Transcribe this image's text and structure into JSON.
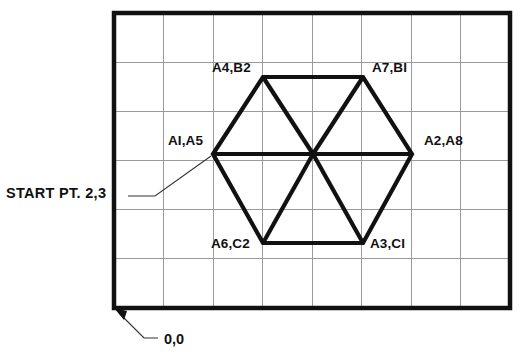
{
  "diagram": {
    "colors": {
      "frame": "#111111",
      "grid": "#9a9a9a",
      "shape": "#111111",
      "leader": "#333333",
      "text": "#111111",
      "background": "#ffffff"
    },
    "frame": {
      "x": 114,
      "y": 13,
      "width": 396,
      "height": 295,
      "stroke_width": 4.5,
      "columns": 8,
      "rows": 6
    },
    "grid": {
      "visible": true,
      "stroke_width": 1,
      "cell_width": 49.5,
      "cell_height": 49.17,
      "vertical_lines": [
        163.5,
        213,
        262.5,
        312,
        361.5,
        411,
        460.5
      ],
      "horizontal_lines": [
        62.2,
        111.3,
        160.5,
        209.7,
        258.8
      ]
    },
    "shape": {
      "type": "hexagon-with-internal-triangles",
      "stroke_width": 4.2,
      "center": {
        "x": 313,
        "y": 154
      },
      "vertices": [
        {
          "id": "v1",
          "label": "AI,A5",
          "x": 213,
          "y": 154,
          "grid": "2,3",
          "label_x": 168,
          "label_y": 145,
          "anchor": "start"
        },
        {
          "id": "v2",
          "label": "A4,B2",
          "x": 263,
          "y": 77,
          "grid": "3,4.7",
          "label_x": 212,
          "label_y": 72,
          "anchor": "start"
        },
        {
          "id": "v3",
          "label": "A7,BI",
          "x": 363,
          "y": 77,
          "grid": "5,4.7",
          "label_x": 372,
          "label_y": 72,
          "anchor": "start"
        },
        {
          "id": "v4",
          "label": "A2,A8",
          "x": 412,
          "y": 154,
          "grid": "6,3",
          "label_x": 424,
          "label_y": 145,
          "anchor": "start"
        },
        {
          "id": "v5",
          "label": "A3,CI",
          "x": 363,
          "y": 243,
          "grid": "5,1.3",
          "label_x": 370,
          "label_y": 248,
          "anchor": "start"
        },
        {
          "id": "v6",
          "label": "A6,C2",
          "x": 263,
          "y": 243,
          "grid": "3,1.3",
          "label_x": 211,
          "label_y": 248,
          "anchor": "start"
        }
      ],
      "internal_lines": [
        {
          "from": "v1",
          "to": "v4",
          "description": "horizontal-diameter"
        },
        {
          "from": "v2",
          "to": "center",
          "description": "spoke-upper-left"
        },
        {
          "from": "v3",
          "to": "center",
          "description": "spoke-upper-right"
        },
        {
          "from": "v5",
          "to": "center",
          "description": "spoke-lower-right"
        },
        {
          "from": "v6",
          "to": "center",
          "description": "spoke-lower-left"
        }
      ]
    },
    "annotations": {
      "start_point": {
        "text": "START PT. 2,3",
        "text_x": 6,
        "text_y": 198,
        "leader": {
          "x1": 128,
          "y1": 196,
          "x2": 155,
          "y2": 196,
          "x3": 211,
          "y3": 156
        }
      },
      "origin": {
        "text": "0,0",
        "text_x": 164,
        "text_y": 344,
        "leader": {
          "x1": 158,
          "y1": 338,
          "x2": 144,
          "y2": 338,
          "x3": 118,
          "y3": 312
        },
        "arrow_at": "frame-bottom-left-corner"
      }
    }
  }
}
